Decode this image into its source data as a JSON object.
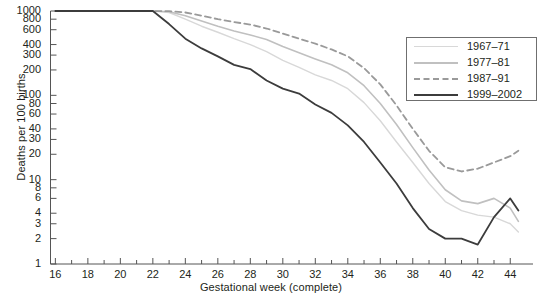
{
  "chart_data": {
    "type": "line",
    "title": "",
    "xlabel": "Gestational week (complete)",
    "ylabel": "Deaths per 100 births",
    "xlim": [
      15.7,
      45.4
    ],
    "ylim": [
      1,
      1000
    ],
    "yscale": "log",
    "grid": false,
    "legend_position": "upper-right",
    "xticks": [
      16,
      18,
      20,
      22,
      24,
      26,
      28,
      30,
      32,
      34,
      36,
      38,
      40,
      42,
      44
    ],
    "xminorticks": [
      17,
      19,
      21,
      23,
      25,
      27,
      29,
      31,
      33,
      35,
      37,
      39,
      41,
      43
    ],
    "yticks": [
      1,
      2,
      3,
      4,
      6,
      8,
      10,
      20,
      30,
      40,
      60,
      80,
      100,
      200,
      300,
      400,
      600,
      800,
      1000
    ],
    "x": [
      16,
      17,
      18,
      19,
      20,
      21,
      22,
      23,
      24,
      25,
      26,
      27,
      28,
      29,
      30,
      31,
      32,
      33,
      34,
      35,
      36,
      37,
      38,
      39,
      40,
      41,
      42,
      43,
      44,
      44.5
    ],
    "series": [
      {
        "name": "1967-71",
        "color": "#d8d8d8",
        "dash": "none",
        "width": 1.4,
        "values": [
          1000,
          1000,
          1000,
          1000,
          1000,
          1000,
          1000,
          960,
          800,
          660,
          560,
          470,
          400,
          330,
          260,
          215,
          175,
          150,
          120,
          82,
          50,
          28,
          16,
          9.0,
          5.5,
          4.3,
          3.8,
          3.6,
          3.0,
          2.4
        ]
      },
      {
        "name": "1977-81",
        "color": "#c0c0c0",
        "dash": "none",
        "width": 1.6,
        "values": [
          1000,
          1000,
          1000,
          1000,
          1000,
          1000,
          1000,
          980,
          880,
          760,
          660,
          580,
          520,
          460,
          380,
          320,
          270,
          230,
          185,
          130,
          80,
          45,
          24,
          13,
          7.6,
          5.6,
          5.2,
          6.0,
          4.6,
          3.2
        ]
      },
      {
        "name": "1987-91",
        "color": "#9a9a9a",
        "dash": "dashed",
        "width": 1.8,
        "values": [
          1000,
          1000,
          1000,
          1000,
          1000,
          1000,
          1000,
          995,
          960,
          880,
          800,
          740,
          690,
          620,
          540,
          470,
          410,
          350,
          290,
          210,
          135,
          76,
          40,
          22,
          14,
          12.5,
          13.5,
          16,
          19,
          22
        ]
      },
      {
        "name": "1999-2002",
        "color": "#3c3c3c",
        "dash": "none",
        "width": 1.8,
        "values": [
          1000,
          1000,
          1000,
          1000,
          1000,
          1000,
          1000,
          700,
          470,
          360,
          290,
          230,
          205,
          150,
          120,
          105,
          78,
          62,
          44,
          28,
          16,
          9.0,
          4.6,
          2.6,
          2.0,
          2.0,
          1.7,
          3.6,
          6.0,
          4.3
        ]
      }
    ]
  },
  "legend": {
    "items": [
      {
        "label": "1967–71"
      },
      {
        "label": "1977–81"
      },
      {
        "label": "1987–91"
      },
      {
        "label": "1999–2002"
      }
    ]
  },
  "axis": {
    "y_title": "Deaths per 100 births",
    "x_title": "Gestational week (complete)",
    "ylabels": [
      "1000",
      "800",
      "600",
      "400",
      "300",
      "200",
      "100",
      "80",
      "60",
      "40",
      "30",
      "20",
      "10",
      "8",
      "6",
      "4",
      "3",
      "2",
      "1"
    ],
    "xlabels": [
      "16",
      "18",
      "20",
      "22",
      "24",
      "26",
      "28",
      "30",
      "32",
      "34",
      "36",
      "38",
      "40",
      "42",
      "44"
    ]
  }
}
